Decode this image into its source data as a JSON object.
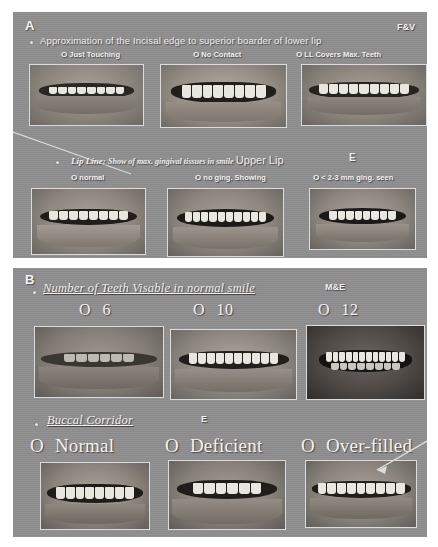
{
  "figure": {
    "background": "#ffffff",
    "panel_background": "#8e8e8e"
  },
  "panels": [
    {
      "letter": "A",
      "corner_tag": "F&V",
      "sections": [
        {
          "heading": "Approximation of the Incisal edge  to superior boarder of lower lip",
          "heading_style": "sans",
          "side_tag": "",
          "options": [
            {
              "marker": "O",
              "label": "Just Touching"
            },
            {
              "marker": "O",
              "label": "No Contact"
            },
            {
              "marker": "O",
              "label": "LL Covers  Max. Teeth"
            }
          ],
          "photos": [
            {
              "caption": "just-touching-smile"
            },
            {
              "caption": "no-contact-smile"
            },
            {
              "caption": "lower-lip-covers-maxillary-teeth-smile"
            }
          ]
        },
        {
          "heading": "Lip Line:",
          "heading_sub": "Show of max. gingival tissues in smile",
          "heading_extra": "Upper Lip",
          "side_tag": "E",
          "options": [
            {
              "marker": "O",
              "label": "normal"
            },
            {
              "marker": "O",
              "label": "no ging. Showing"
            },
            {
              "marker": "O",
              "label": "< 2-3 mm ging. seen"
            }
          ],
          "photos": [
            {
              "caption": "normal-lip-line-smile"
            },
            {
              "caption": "no-gingiva-showing-smile"
            },
            {
              "caption": "2-3mm-gingiva-seen-smile"
            }
          ]
        }
      ]
    },
    {
      "letter": "B",
      "corner_tag": "",
      "sections": [
        {
          "heading": "Number of Teeth Visable in normal smile",
          "side_tag": "M&E",
          "options": [
            {
              "marker": "O",
              "label": "6"
            },
            {
              "marker": "O",
              "label": "10"
            },
            {
              "marker": "O",
              "label": "12"
            }
          ],
          "photos": [
            {
              "caption": "six-teeth-visible-smile"
            },
            {
              "caption": "ten-teeth-visible-smile"
            },
            {
              "caption": "twelve-teeth-visible-smile"
            }
          ]
        },
        {
          "heading": "Buccal Corridor",
          "side_tag": "E",
          "options": [
            {
              "marker": "O",
              "label": "Normal"
            },
            {
              "marker": "O",
              "label": "Deficient"
            },
            {
              "marker": "O",
              "label": "Over-filled"
            }
          ],
          "photos": [
            {
              "caption": "normal-buccal-corridor-smile"
            },
            {
              "caption": "deficient-buccal-corridor-smile"
            },
            {
              "caption": "over-filled-buccal-corridor-smile"
            }
          ]
        }
      ]
    }
  ]
}
